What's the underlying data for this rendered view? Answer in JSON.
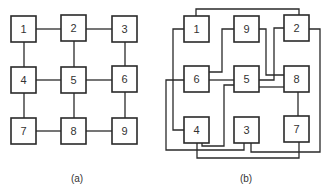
{
  "colors": {
    "stroke": "#2a2a2a",
    "text": "#333333",
    "background": "#ffffff"
  },
  "diagram_a": {
    "caption": "(a)",
    "nodes": [
      {
        "label": "1",
        "x": 11,
        "y": 16
      },
      {
        "label": "2",
        "x": 61,
        "y": 15
      },
      {
        "label": "3",
        "x": 112,
        "y": 16
      },
      {
        "label": "4",
        "x": 11,
        "y": 67
      },
      {
        "label": "5",
        "x": 61,
        "y": 67
      },
      {
        "label": "6",
        "x": 112,
        "y": 66
      },
      {
        "label": "7",
        "x": 11,
        "y": 118
      },
      {
        "label": "8",
        "x": 61,
        "y": 118
      },
      {
        "label": "9",
        "x": 112,
        "y": 118
      }
    ],
    "edges": [
      [
        "1",
        "2"
      ],
      [
        "2",
        "3"
      ],
      [
        "4",
        "5"
      ],
      [
        "5",
        "6"
      ],
      [
        "7",
        "8"
      ],
      [
        "8",
        "9"
      ],
      [
        "1",
        "4"
      ],
      [
        "4",
        "7"
      ],
      [
        "2",
        "5"
      ],
      [
        "5",
        "8"
      ],
      [
        "3",
        "6"
      ],
      [
        "6",
        "9"
      ]
    ]
  },
  "diagram_b": {
    "caption": "(b)",
    "nodes": [
      {
        "label": "1",
        "x": 184,
        "y": 16
      },
      {
        "label": "9",
        "x": 234,
        "y": 16
      },
      {
        "label": "2",
        "x": 284,
        "y": 15
      },
      {
        "label": "6",
        "x": 184,
        "y": 66
      },
      {
        "label": "5",
        "x": 234,
        "y": 66
      },
      {
        "label": "8",
        "x": 284,
        "y": 66
      },
      {
        "label": "4",
        "x": 184,
        "y": 117
      },
      {
        "label": "3",
        "x": 234,
        "y": 117
      },
      {
        "label": "7",
        "x": 284,
        "y": 116
      }
    ],
    "edges": [
      [
        "1",
        "2"
      ],
      [
        "1",
        "4"
      ],
      [
        "9",
        "6"
      ],
      [
        "9",
        "8"
      ],
      [
        "2",
        "5"
      ],
      [
        "6",
        "5"
      ],
      [
        "6",
        "3"
      ],
      [
        "5",
        "4"
      ],
      [
        "5",
        "8"
      ],
      [
        "8",
        "7"
      ],
      [
        "2",
        "3"
      ],
      [
        "4",
        "7"
      ]
    ]
  }
}
